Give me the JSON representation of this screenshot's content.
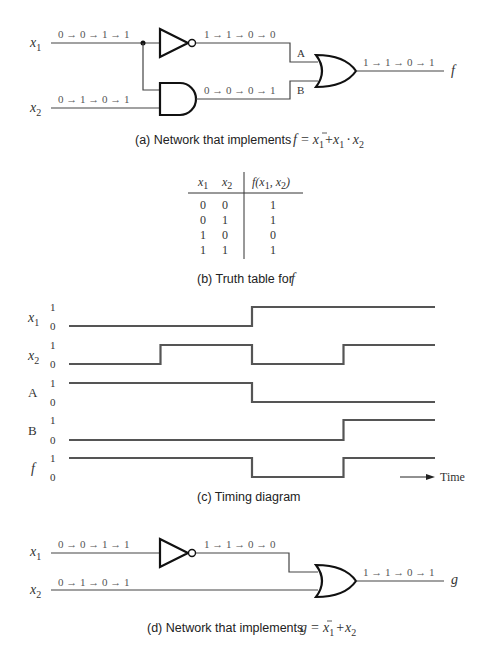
{
  "network_a": {
    "inputs": [
      {
        "name": "x",
        "sub": "1",
        "sequence": "0 → 0 → 1 → 1"
      },
      {
        "name": "x",
        "sub": "2",
        "sequence": "0 → 1 → 0 → 1"
      }
    ],
    "not_output_sequence": "1 → 1 → 0 → 0",
    "and_output_sequence": "0 → 0 → 0 → 1",
    "wire_A_label": "A",
    "wire_B_label": "B",
    "output_sequence": "1 → 1 → 0 → 1",
    "output_name": "f",
    "caption_prefix": "(a) Network that  implements",
    "caption_formula": "f = x̄₁ + x₁ · x₂"
  },
  "truth_table": {
    "headers": [
      "x1",
      "x2",
      "f(x1, x2)"
    ],
    "rows": [
      [
        "0",
        "0",
        "1"
      ],
      [
        "0",
        "1",
        "1"
      ],
      [
        "1",
        "0",
        "0"
      ],
      [
        "1",
        "1",
        "1"
      ]
    ],
    "caption_prefix": "(b) Truth table for",
    "caption_var": "f"
  },
  "timing": {
    "signals": [
      {
        "label": "x",
        "sub": "1",
        "values": [
          0,
          0,
          1,
          1
        ]
      },
      {
        "label": "x",
        "sub": "2",
        "values": [
          0,
          1,
          0,
          1
        ]
      },
      {
        "label": "A",
        "sub": "",
        "values": [
          1,
          1,
          0,
          0
        ]
      },
      {
        "label": "B",
        "sub": "",
        "values": [
          0,
          0,
          0,
          1
        ]
      },
      {
        "label": "f",
        "sub": "",
        "values": [
          1,
          1,
          0,
          1
        ]
      }
    ],
    "level_high": "1",
    "level_low": "0",
    "time_label": "Time",
    "caption": "(c) Timing diagram"
  },
  "network_d": {
    "inputs": [
      {
        "name": "x",
        "sub": "1",
        "sequence": "0 → 0 → 1 → 1"
      },
      {
        "name": "x",
        "sub": "2",
        "sequence": "0 → 1 → 0 → 1"
      }
    ],
    "not_output_sequence": "1 → 1 → 0 → 0",
    "output_sequence": "1 → 1 → 0 → 1",
    "output_name": "g",
    "caption_prefix": "(d) Network that implements",
    "caption_formula": "g = x̄₁ + x₂"
  }
}
